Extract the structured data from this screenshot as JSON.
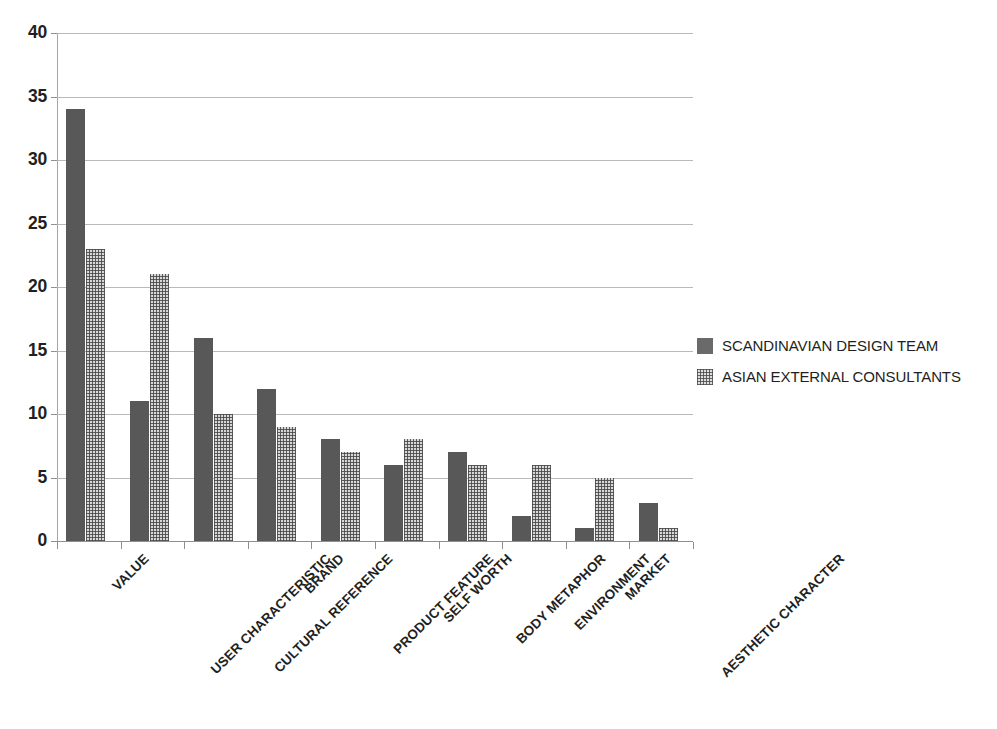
{
  "chart_data": {
    "type": "bar",
    "title": "",
    "xlabel": "",
    "ylabel": "",
    "ylim": [
      0,
      40
    ],
    "y_ticks": [
      0,
      5,
      10,
      15,
      20,
      25,
      30,
      35,
      40
    ],
    "grid": true,
    "legend_position": "right",
    "categories": [
      "VALUE",
      "USER CHARACTERISTIC",
      "CULTURAL REFERENCE",
      "BRAND",
      "PRODUCT FEATURE",
      "SELF WORTH",
      "BODY METAPHOR",
      "ENVIRONMENT",
      "MARKET",
      "AESTHETIC CHARACTER"
    ],
    "series": [
      {
        "name": "SCANDINAVIAN DESIGN TEAM",
        "color": "#585858",
        "pattern": "solid",
        "values": [
          34,
          11,
          16,
          12,
          8,
          6,
          7,
          2,
          1,
          3
        ]
      },
      {
        "name": "ASIAN EXTERNAL CONSULTANTS",
        "color": "#d8d8d8",
        "pattern": "crosshatch",
        "values": [
          23,
          21,
          10,
          9,
          7,
          8,
          6,
          6,
          5,
          1
        ]
      }
    ]
  },
  "legend": {
    "items": [
      {
        "label": "SCANDINAVIAN DESIGN TEAM"
      },
      {
        "label": "ASIAN EXTERNAL CONSULTANTS"
      }
    ]
  }
}
